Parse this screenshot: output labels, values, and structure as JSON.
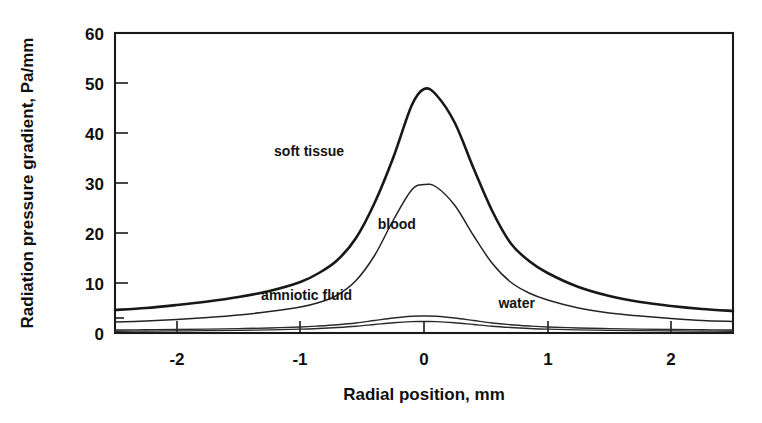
{
  "chart_data": {
    "type": "line",
    "title": "",
    "xlabel": "Radial position, mm",
    "ylabel": "Radiation pressure gradient, Pa/mm",
    "xlim": [
      -2.5,
      2.5
    ],
    "ylim": [
      0,
      60
    ],
    "xticks": [
      "-2",
      "-1",
      "0",
      "1",
      "2"
    ],
    "xtick_values": [
      -2,
      -1,
      0,
      1,
      2
    ],
    "yticks": [
      "0",
      "10",
      "20",
      "30",
      "40",
      "50",
      "60"
    ],
    "ytick_values": [
      0,
      10,
      20,
      30,
      40,
      50,
      60
    ],
    "grid": false,
    "legend": "inline-curve-labels",
    "x": [
      -2.5,
      -2.25,
      -2.0,
      -1.75,
      -1.5,
      -1.25,
      -1.0,
      -0.85,
      -0.7,
      -0.55,
      -0.4,
      -0.25,
      -0.1,
      0.0,
      0.1,
      0.25,
      0.4,
      0.55,
      0.7,
      0.85,
      1.0,
      1.25,
      1.5,
      1.75,
      2.0,
      2.25,
      2.5
    ],
    "series": [
      {
        "name": "soft tissue",
        "label_x": -0.93,
        "label_y": 35.5,
        "peak": 49,
        "values": [
          4.6,
          5.0,
          5.6,
          6.3,
          7.2,
          8.4,
          10.2,
          12.0,
          14.6,
          19.0,
          26.0,
          35.0,
          45.5,
          48.8,
          47.6,
          42.0,
          33.0,
          24.5,
          18.0,
          14.4,
          12.0,
          9.2,
          7.4,
          6.2,
          5.4,
          4.8,
          4.4
        ]
      },
      {
        "name": "blood",
        "label_x": -0.22,
        "label_y": 20.8,
        "peak": 30,
        "values": [
          2.2,
          2.4,
          2.7,
          3.1,
          3.6,
          4.3,
          5.2,
          6.1,
          7.6,
          10.5,
          15.5,
          22.5,
          28.6,
          29.7,
          29.2,
          25.5,
          19.5,
          14.0,
          10.2,
          8.0,
          6.6,
          5.0,
          4.0,
          3.4,
          2.9,
          2.5,
          2.3
        ]
      },
      {
        "name": "amniotic fluid",
        "label_x": -0.95,
        "label_y": 6.6,
        "peak": 3.4,
        "values": [
          0.6,
          0.65,
          0.7,
          0.78,
          0.88,
          1.0,
          1.2,
          1.4,
          1.65,
          2.0,
          2.5,
          3.0,
          3.35,
          3.4,
          3.35,
          3.0,
          2.5,
          2.0,
          1.65,
          1.4,
          1.2,
          1.0,
          0.88,
          0.78,
          0.7,
          0.65,
          0.6
        ]
      },
      {
        "name": "water",
        "label_x": 0.75,
        "label_y": 5.0,
        "peak": 2.3,
        "values": [
          0.35,
          0.38,
          0.42,
          0.47,
          0.54,
          0.63,
          0.76,
          0.9,
          1.1,
          1.35,
          1.7,
          2.05,
          2.28,
          2.3,
          2.28,
          2.05,
          1.7,
          1.35,
          1.1,
          0.9,
          0.76,
          0.63,
          0.54,
          0.47,
          0.42,
          0.38,
          0.35
        ]
      }
    ],
    "colors": {
      "ink": "#1a1a1a",
      "background": "#ffffff"
    }
  }
}
